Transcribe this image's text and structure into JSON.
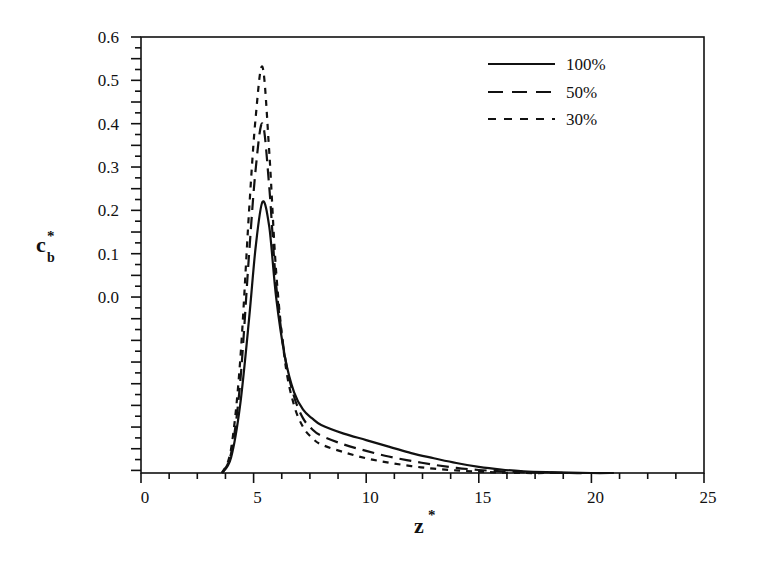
{
  "chart_data": {
    "type": "line",
    "title": "",
    "xlabel": "z*",
    "ylabel": "c_b*",
    "xlim": [
      0,
      25
    ],
    "ylim": [
      -0.406,
      0.6
    ],
    "grid": false,
    "legend_position": "upper right",
    "x_ticks": [
      0,
      5,
      10,
      15,
      20,
      25
    ],
    "x_tick_labels": [
      "0",
      "5",
      "10",
      "15",
      "20",
      "25"
    ],
    "y_tick_labels": [
      "0.6",
      "0.5",
      "0.4",
      "0.3",
      "0.2",
      "0.1",
      "0.0"
    ],
    "y_ticks": [
      0.6,
      0.5,
      0.4,
      0.3,
      0.2,
      0.1,
      0.0
    ],
    "series": [
      {
        "name": "100%",
        "style": "solid",
        "x": [
          3.6,
          4.0,
          4.4,
          4.8,
          5.1,
          5.4,
          5.7,
          6.0,
          6.4,
          6.8,
          7.2,
          7.6,
          8.0,
          9.0,
          10.0,
          11.0,
          12.0,
          13.0,
          14.0,
          15.0,
          16.0,
          17.0,
          18.0,
          19.0,
          20.0,
          21.0
        ],
        "y": [
          -0.406,
          -0.37,
          -0.25,
          -0.05,
          0.12,
          0.22,
          0.16,
          0.0,
          -0.14,
          -0.22,
          -0.26,
          -0.28,
          -0.295,
          -0.315,
          -0.33,
          -0.345,
          -0.36,
          -0.372,
          -0.383,
          -0.392,
          -0.398,
          -0.402,
          -0.404,
          -0.405,
          -0.406,
          -0.406
        ]
      },
      {
        "name": "50%",
        "style": "dashed",
        "x": [
          3.6,
          4.0,
          4.4,
          4.8,
          5.1,
          5.4,
          5.7,
          6.0,
          6.4,
          6.8,
          7.2,
          7.6,
          8.0,
          9.0,
          10.0,
          11.0,
          12.0,
          13.0,
          14.0,
          15.0,
          16.0,
          17.0,
          18.0,
          19.0,
          20.0
        ],
        "y": [
          -0.406,
          -0.36,
          -0.2,
          0.1,
          0.3,
          0.4,
          0.25,
          0.03,
          -0.14,
          -0.23,
          -0.28,
          -0.305,
          -0.32,
          -0.34,
          -0.355,
          -0.368,
          -0.378,
          -0.387,
          -0.394,
          -0.399,
          -0.402,
          -0.404,
          -0.405,
          -0.406,
          -0.406
        ]
      },
      {
        "name": "30%",
        "style": "short-dashed",
        "x": [
          3.6,
          4.0,
          4.4,
          4.8,
          5.1,
          5.4,
          5.7,
          6.0,
          6.4,
          6.8,
          7.2,
          7.6,
          8.0,
          9.0,
          10.0,
          11.0,
          12.0,
          13.0,
          14.0,
          15.0,
          16.0,
          17.0,
          18.0,
          19.0
        ],
        "y": [
          -0.406,
          -0.35,
          -0.15,
          0.2,
          0.42,
          0.53,
          0.33,
          0.06,
          -0.15,
          -0.25,
          -0.3,
          -0.325,
          -0.34,
          -0.358,
          -0.372,
          -0.382,
          -0.39,
          -0.396,
          -0.4,
          -0.403,
          -0.405,
          -0.406,
          -0.406,
          -0.406
        ]
      }
    ]
  },
  "axes": {
    "x_title": "z",
    "x_title_sup": "*",
    "y_title": "c",
    "y_title_sub": "b",
    "y_title_sup": "*"
  },
  "legend": {
    "items": [
      {
        "label": "100%",
        "style": "solid"
      },
      {
        "label": "50%",
        "style": "dashed"
      },
      {
        "label": "30%",
        "style": "short-dashed"
      }
    ]
  },
  "colors": {
    "line": "#111111",
    "background": "#ffffff"
  }
}
